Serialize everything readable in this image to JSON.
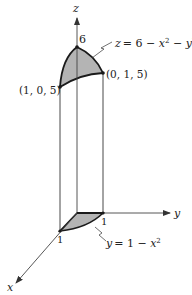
{
  "figure": {
    "axes": {
      "x_label": "x",
      "y_label": "y",
      "z_label": "z"
    },
    "surface_equation": {
      "lhs": "z",
      "rhs": "= 6 − x",
      "tail": " − y",
      "exp": "2"
    },
    "base_curve_equation": {
      "lhs": "y",
      "rhs": "= 1 − x",
      "exp": "2"
    },
    "points": {
      "peak_label": "6",
      "right_top": "(0, 1, 5)",
      "left_top": "(1, 0, 5)"
    },
    "ticks": {
      "x_one": "1",
      "y_one": "1"
    },
    "colors": {
      "fill": "#b4b4b4",
      "line": "#1a1a1a",
      "axis": "#555555"
    }
  }
}
